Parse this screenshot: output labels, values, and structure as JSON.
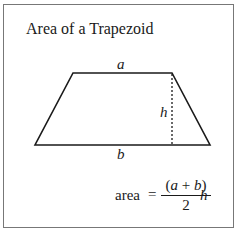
{
  "title": "Area of a Trapezoid",
  "shape": {
    "type": "trapezoid",
    "vertices": {
      "top_left": [
        73,
        73
      ],
      "top_right": [
        172,
        73
      ],
      "bottom_right": [
        210,
        145
      ],
      "bottom_left": [
        35,
        145
      ]
    },
    "height_line": {
      "x": 172,
      "y1": 73,
      "y2": 145,
      "style": "dotted"
    }
  },
  "labels": {
    "top_base": "a",
    "bottom_base": "b",
    "height": "h"
  },
  "formula": {
    "lhs": "area",
    "equals": "=",
    "numerator_open": "(",
    "numerator_a": "a",
    "numerator_plus": " + ",
    "numerator_b": "b",
    "numerator_close": ")",
    "denominator": "2",
    "multiplier": "h"
  },
  "colors": {
    "stroke": "#1a1a1a",
    "frame": "#777777",
    "background": "#ffffff"
  }
}
